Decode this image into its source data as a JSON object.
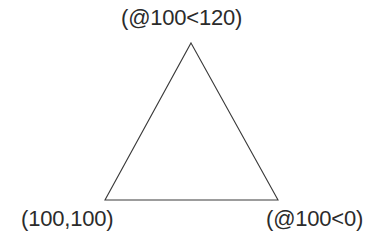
{
  "figure": {
    "background_color": "#ffffff",
    "stroke_color": "#3a3a3a",
    "text_color": "#2b2b2b",
    "width": 389,
    "height": 252
  },
  "shape": {
    "type": "triangle",
    "points": "191,43 278,200 105,200"
  },
  "labels": {
    "apex": "(@100<120)",
    "bottom_left": "(100,100)",
    "bottom_right": "(@100<0)"
  }
}
